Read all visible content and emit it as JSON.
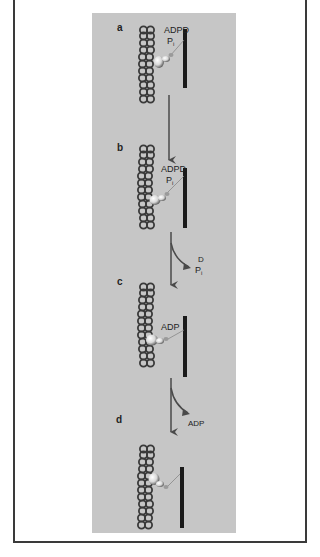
{
  "figure": {
    "type": "myosin cross-bridge cycle schematic",
    "panels": [
      {
        "id": "a",
        "label": "a",
        "nucleotide_labels": [
          "ADPD",
          "Pi"
        ],
        "filament_top": 27,
        "bar_top": 29,
        "bar_bottom": 88,
        "head": {
          "x": 160,
          "y": 62
        }
      },
      {
        "id": "b",
        "label": "b",
        "nucleotide_labels": [
          "ADPD",
          "Pi"
        ],
        "filament_top": 145,
        "bar_top": 168,
        "bar_bottom": 228,
        "head": {
          "x": 155,
          "y": 200
        }
      },
      {
        "id": "c",
        "label": "c",
        "nucleotide_labels": [
          "ADP"
        ],
        "filament_top": 283,
        "bar_top": 316,
        "bar_bottom": 377,
        "head": {
          "x": 152,
          "y": 340
        }
      },
      {
        "id": "d",
        "label": "d",
        "nucleotide_labels": [],
        "filament_top": 445,
        "bar_top": 467,
        "bar_bottom": 528,
        "head": {
          "x": 153,
          "y": 480
        }
      }
    ],
    "transitions": [
      {
        "from": "a",
        "to": "b",
        "released": []
      },
      {
        "from": "b",
        "to": "c",
        "released": [
          "D",
          "Pi"
        ]
      },
      {
        "from": "c",
        "to": "d",
        "released": [
          "ADP"
        ]
      }
    ],
    "colors": {
      "panel_bg": "#c6c6c6",
      "frame": "#3a3a3a",
      "filament_bead": "#3a3a3a",
      "thick_bar": "#1a1a1a",
      "arrow": "#4a4a4a",
      "head_highlight": "#f4f4f4"
    },
    "text": {
      "label_a": "a",
      "label_b": "b",
      "label_c": "c",
      "label_d": "d",
      "adpd_a": "ADPD",
      "pi_a": "P",
      "pi_sub": "i",
      "adpd_b": "ADPD",
      "pi_b": "P",
      "adp_c": "ADP",
      "release_box": "D",
      "release_pi": "P",
      "release_adp": "ADP"
    }
  }
}
